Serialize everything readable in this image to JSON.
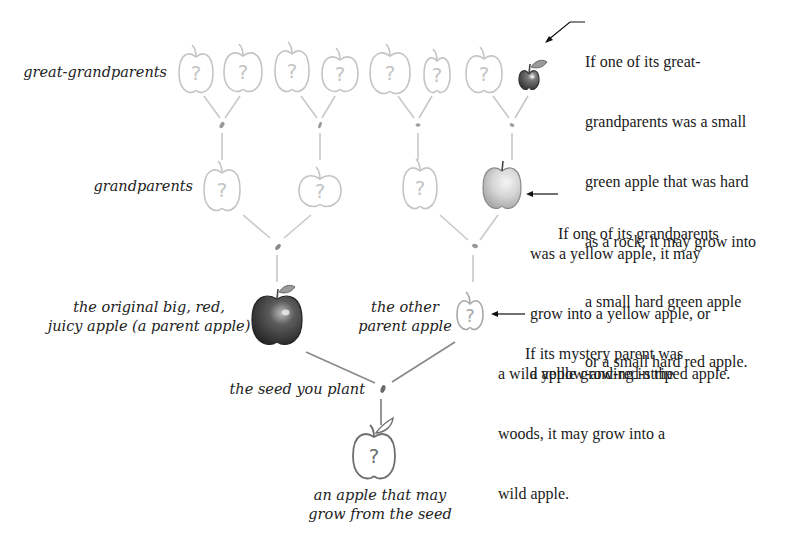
{
  "labels": {
    "great_grandparents": "great-grandparents",
    "grandparents": "grandparents",
    "original_apple_line1": "the original big, red,",
    "original_apple_line2": "juicy apple (a parent apple)",
    "other_parent_line1": "the other",
    "other_parent_line2": "parent apple",
    "seed": "the seed you plant",
    "result_line1": "an apple that may",
    "result_line2": "grow from the seed"
  },
  "notes": {
    "great_grandparent": [
      "If one of its great-",
      "grandparents was a small",
      "green apple that was hard",
      "as a rock, it may grow into",
      "a small hard green apple",
      "or a small hard red apple."
    ],
    "grandparent": [
      "If one of its grandparents",
      "was a yellow apple, it may",
      "grow into a yellow apple, or",
      "a yellow-and-red-striped apple."
    ],
    "mystery_parent": [
      "If its mystery parent was",
      "a wild apple growing in the",
      "woods, it may grow into a",
      "wild apple."
    ]
  },
  "apple_glyph": "?",
  "tree": {
    "great_grandparents": [
      {
        "kind": "unknown"
      },
      {
        "kind": "unknown"
      },
      {
        "kind": "unknown"
      },
      {
        "kind": "unknown"
      },
      {
        "kind": "unknown"
      },
      {
        "kind": "unknown"
      },
      {
        "kind": "unknown"
      },
      {
        "kind": "small-hard-green"
      }
    ],
    "grandparents": [
      {
        "kind": "unknown"
      },
      {
        "kind": "unknown"
      },
      {
        "kind": "unknown"
      },
      {
        "kind": "yellow"
      }
    ],
    "parents": [
      {
        "kind": "big-red"
      },
      {
        "kind": "unknown"
      }
    ],
    "result": {
      "kind": "unknown"
    }
  }
}
